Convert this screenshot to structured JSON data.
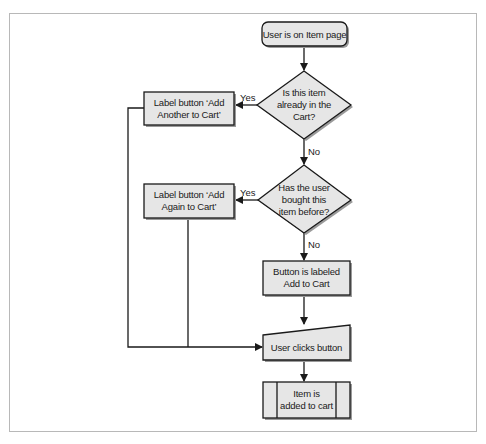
{
  "diagram": {
    "type": "flowchart",
    "colors": {
      "node_fill": "#e6e6e6",
      "stroke": "#1a1a1a",
      "frame": "#b8b8b8",
      "shadow": "#9a9a9a"
    },
    "nodes": {
      "start": {
        "shape": "terminal",
        "text": [
          "User is on Item page"
        ]
      },
      "decision1": {
        "shape": "diamond",
        "text": [
          "Is this item",
          "already in the",
          "Cart?"
        ]
      },
      "label_another": {
        "shape": "process",
        "text": [
          "Label button ‘Add",
          "Another to Cart’"
        ]
      },
      "decision2": {
        "shape": "diamond",
        "text": [
          "Has the user",
          "bought this",
          "item before?"
        ]
      },
      "label_again": {
        "shape": "process",
        "text": [
          "Label button ‘Add",
          "Again to Cart’"
        ]
      },
      "label_default": {
        "shape": "process",
        "text": [
          "Button is labeled",
          "Add to Cart"
        ]
      },
      "user_clicks": {
        "shape": "manual-input",
        "text": [
          "User clicks button"
        ]
      },
      "added": {
        "shape": "predefined-process",
        "text": [
          "Item is",
          "added to cart"
        ]
      }
    },
    "edges": [
      {
        "from": "start",
        "to": "decision1",
        "label": ""
      },
      {
        "from": "decision1",
        "to": "label_another",
        "label": "Yes"
      },
      {
        "from": "decision1",
        "to": "decision2",
        "label": "No"
      },
      {
        "from": "decision2",
        "to": "label_again",
        "label": "Yes"
      },
      {
        "from": "decision2",
        "to": "label_default",
        "label": "No"
      },
      {
        "from": "label_another",
        "to": "user_clicks",
        "label": ""
      },
      {
        "from": "label_again",
        "to": "user_clicks",
        "label": ""
      },
      {
        "from": "label_default",
        "to": "user_clicks",
        "label": ""
      },
      {
        "from": "user_clicks",
        "to": "added",
        "label": ""
      }
    ]
  }
}
